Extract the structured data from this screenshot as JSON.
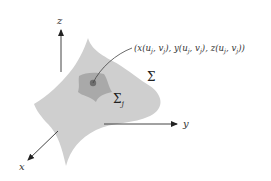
{
  "diagram": {
    "axes": {
      "z": "z",
      "y": "y",
      "x": "x"
    },
    "surface_label": "Σ",
    "patch_label": "Σ",
    "patch_subscript": "j",
    "point_label": "(x(uⱼ, vⱼ), y(uⱼ, vⱼ), z(uⱼ, vⱼ))",
    "colors": {
      "surface": "#cfcfcf",
      "patch": "#a9a9a9",
      "point": "#6e6e6e",
      "axis": "#333333"
    }
  }
}
